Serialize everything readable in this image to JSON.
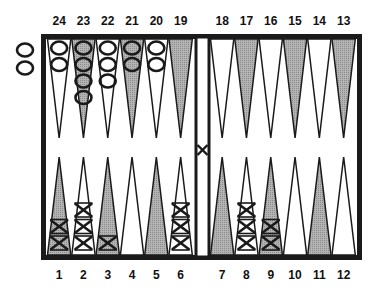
{
  "board": {
    "colors": {
      "frame": "#1a1a1a",
      "dark_point": "#a8a8a8",
      "light_point": "#ffffff",
      "outline": "#1a1a1a",
      "background": "#ffffff"
    },
    "top_labels": [
      "24",
      "23",
      "22",
      "21",
      "20",
      "19",
      "18",
      "17",
      "16",
      "15",
      "14",
      "13"
    ],
    "bottom_labels": [
      "1",
      "2",
      "3",
      "4",
      "5",
      "6",
      "7",
      "8",
      "9",
      "10",
      "11",
      "12"
    ],
    "points": [
      {
        "n": 1,
        "shade": "dark",
        "checkers": 2,
        "player": "X"
      },
      {
        "n": 2,
        "shade": "light",
        "checkers": 3,
        "player": "X"
      },
      {
        "n": 3,
        "shade": "dark",
        "checkers": 1,
        "player": "X"
      },
      {
        "n": 4,
        "shade": "light",
        "checkers": 0,
        "player": ""
      },
      {
        "n": 5,
        "shade": "dark",
        "checkers": 0,
        "player": ""
      },
      {
        "n": 6,
        "shade": "light",
        "checkers": 3,
        "player": "X"
      },
      {
        "n": 7,
        "shade": "dark",
        "checkers": 0,
        "player": ""
      },
      {
        "n": 8,
        "shade": "light",
        "checkers": 3,
        "player": "X"
      },
      {
        "n": 9,
        "shade": "dark",
        "checkers": 2,
        "player": "X"
      },
      {
        "n": 10,
        "shade": "light",
        "checkers": 0,
        "player": ""
      },
      {
        "n": 11,
        "shade": "dark",
        "checkers": 0,
        "player": ""
      },
      {
        "n": 12,
        "shade": "light",
        "checkers": 0,
        "player": ""
      },
      {
        "n": 13,
        "shade": "dark",
        "checkers": 0,
        "player": ""
      },
      {
        "n": 14,
        "shade": "light",
        "checkers": 0,
        "player": ""
      },
      {
        "n": 15,
        "shade": "dark",
        "checkers": 0,
        "player": ""
      },
      {
        "n": 16,
        "shade": "light",
        "checkers": 0,
        "player": ""
      },
      {
        "n": 17,
        "shade": "dark",
        "checkers": 0,
        "player": ""
      },
      {
        "n": 18,
        "shade": "light",
        "checkers": 0,
        "player": ""
      },
      {
        "n": 19,
        "shade": "dark",
        "checkers": 0,
        "player": ""
      },
      {
        "n": 20,
        "shade": "light",
        "checkers": 2,
        "player": "O"
      },
      {
        "n": 21,
        "shade": "dark",
        "checkers": 2,
        "player": "O"
      },
      {
        "n": 22,
        "shade": "light",
        "checkers": 3,
        "player": "O"
      },
      {
        "n": 23,
        "shade": "dark",
        "checkers": 4,
        "player": "O"
      },
      {
        "n": 24,
        "shade": "light",
        "checkers": 2,
        "player": "O"
      }
    ],
    "bar": {
      "player": "X",
      "checkers": 1
    },
    "off_board": {
      "player": "O",
      "checkers": 2
    }
  }
}
